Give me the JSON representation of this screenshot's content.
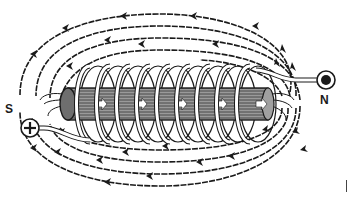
{
  "diagram": {
    "labels": {
      "south": "S",
      "north": "N"
    },
    "terminals": {
      "left": {
        "symbol": "+",
        "name": "positive-terminal"
      },
      "right": {
        "symbol": "●",
        "name": "negative-terminal"
      }
    },
    "core_arrow_glyph": "➔",
    "coil_turns": 9,
    "core_arrows": 5,
    "field_line_direction": "left (outer lines run N to S)",
    "colors": {
      "ink": "#1a1a1a",
      "core_fill": "#8a8a8a",
      "background": "#ffffff"
    }
  }
}
